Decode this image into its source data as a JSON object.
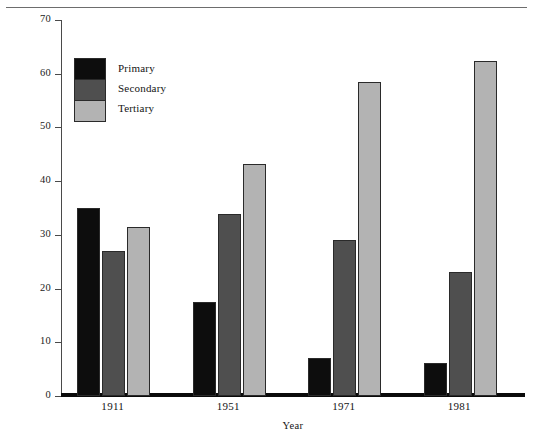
{
  "figure": {
    "y_axis_title": "Percent",
    "x_axis_title": "Year"
  },
  "legend": {
    "entries": [
      {
        "label": "Primary",
        "color": "#0d0d0d"
      },
      {
        "label": "Secondary",
        "color": "#4f4f4f"
      },
      {
        "label": "Tertiary",
        "color": "#b3b3b3"
      }
    ]
  },
  "chart_data": {
    "type": "bar",
    "title": "",
    "xlabel": "Year",
    "ylabel": "Percent",
    "categories": [
      "1911",
      "1951",
      "1971",
      "1981"
    ],
    "series": [
      {
        "name": "Primary",
        "color": "#0d0d0d",
        "values": [
          35.0,
          17.5,
          7.0,
          6.2
        ]
      },
      {
        "name": "Secondary",
        "color": "#4f4f4f",
        "values": [
          27.0,
          33.8,
          29.0,
          23.0
        ]
      },
      {
        "name": "Tertiary",
        "color": "#b3b3b3",
        "values": [
          31.5,
          43.2,
          58.5,
          62.3
        ]
      }
    ],
    "ylim": [
      0,
      70
    ],
    "yticks": [
      0,
      10,
      20,
      30,
      40,
      50,
      60,
      70
    ],
    "ytick_labels": [
      "0",
      "10",
      "20",
      "30",
      "40",
      "50",
      "60",
      "70"
    ],
    "grid": false,
    "legend_position": "upper-left"
  }
}
